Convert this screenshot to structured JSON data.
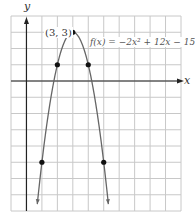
{
  "chart_data": {
    "type": "line",
    "title": "",
    "function_label": "f(x) = -2x² + 12x - 15",
    "xlabel": "x",
    "ylabel": "y",
    "xlim": [
      -1,
      10
    ],
    "ylim": [
      -8,
      4
    ],
    "grid": true,
    "vertex": {
      "x": 3,
      "y": 3,
      "label": "(3, 3)"
    },
    "points": [
      {
        "x": 1,
        "y": -5
      },
      {
        "x": 2,
        "y": 1
      },
      {
        "x": 3,
        "y": 3
      },
      {
        "x": 4,
        "y": 1
      },
      {
        "x": 5,
        "y": -5
      }
    ],
    "series": [
      {
        "name": "f(x) = -2x² + 12x - 15",
        "coefficients": {
          "a": -2,
          "b": 12,
          "c": -15
        }
      }
    ]
  },
  "labels": {
    "y_axis": "y",
    "x_axis": "x",
    "vertex": "(3, 3)",
    "function": "f(x) = −2x² + 12x − 15"
  },
  "colors": {
    "grid": "#c8c8c8",
    "axis": "#222222",
    "curve": "#666666",
    "point": "#111111",
    "text": "#333333"
  }
}
